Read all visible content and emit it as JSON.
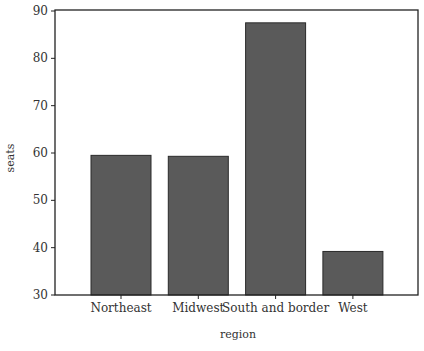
{
  "chart_data": {
    "type": "bar",
    "title": "",
    "xlabel": "region",
    "ylabel": "seats",
    "categories": [
      "Northeast",
      "Midwest",
      "South and border",
      "West"
    ],
    "values": [
      59.5,
      59.3,
      87.5,
      39.2
    ],
    "ylim": [
      30,
      90
    ],
    "yticks": [
      30,
      40,
      50,
      60,
      70,
      80,
      90
    ],
    "grid": false,
    "legend": null,
    "bar_color": "#5a5a5a",
    "bar_edge_color": "#2a2a2a"
  }
}
